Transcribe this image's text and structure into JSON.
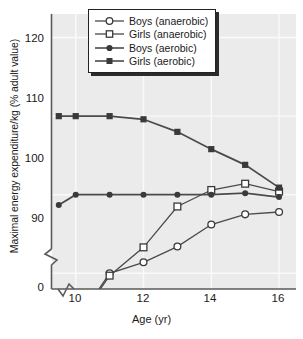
{
  "chart_data": {
    "type": "line",
    "title": "",
    "xlabel": "Age (yr)",
    "ylabel": "Maximal energy expenditure/kg (% adult value)",
    "xlim": [
      9.3,
      16.5
    ],
    "ylim": [
      88,
      123
    ],
    "xticks": [
      10,
      12,
      14,
      16
    ],
    "yticks": [
      90,
      100,
      110,
      120
    ],
    "y_axis_break": true,
    "y_break_label": "0",
    "grid": true,
    "legend_position": "top-center",
    "x": [
      9.5,
      10,
      11,
      12,
      13,
      14,
      15,
      16
    ],
    "series": [
      {
        "name": "Boys (anaerobic)",
        "marker": "open-circle",
        "values": [
          83.0,
          83.6,
          90.0,
          91.4,
          93.4,
          96.2,
          97.5,
          97.8
        ]
      },
      {
        "name": "Girls (anaerobic)",
        "marker": "open-square",
        "values": [
          81.0,
          83.5,
          89.7,
          93.3,
          98.5,
          100.6,
          101.4,
          100.4
        ]
      },
      {
        "name": "Boys (aerobic)",
        "marker": "filled-circle",
        "values": [
          98.7,
          100.0,
          100.0,
          100.0,
          100.0,
          100.0,
          100.2,
          99.7
        ]
      },
      {
        "name": "Girls (aerobic)",
        "marker": "filled-square",
        "values": [
          110.0,
          110.0,
          110.0,
          109.6,
          108.0,
          105.8,
          103.8,
          100.9
        ]
      }
    ]
  },
  "axis": {
    "ytick_labels": [
      "120",
      "110",
      "100",
      "90"
    ],
    "break_label": "0",
    "xtick_labels": [
      "10",
      "12",
      "14",
      "16"
    ],
    "xtitle": "Age (yr)"
  },
  "legend": {
    "items": [
      {
        "label": "Boys (anaerobic)",
        "marker": "open-circle"
      },
      {
        "label": "Girls (anaerobic)",
        "marker": "open-square"
      },
      {
        "label": "Boys (aerobic)",
        "marker": "filled-circle"
      },
      {
        "label": "Girls (aerobic)",
        "marker": "filled-square"
      }
    ]
  },
  "colors": {
    "plot_background": "#ebebeb",
    "gridline": "#fafafa",
    "line": "#4a4a4a",
    "marker_fill_open": "#ffffff",
    "marker_fill_solid": "#3a3a3a",
    "axis": "#5a5a5a",
    "text": "#1a1a1a"
  }
}
